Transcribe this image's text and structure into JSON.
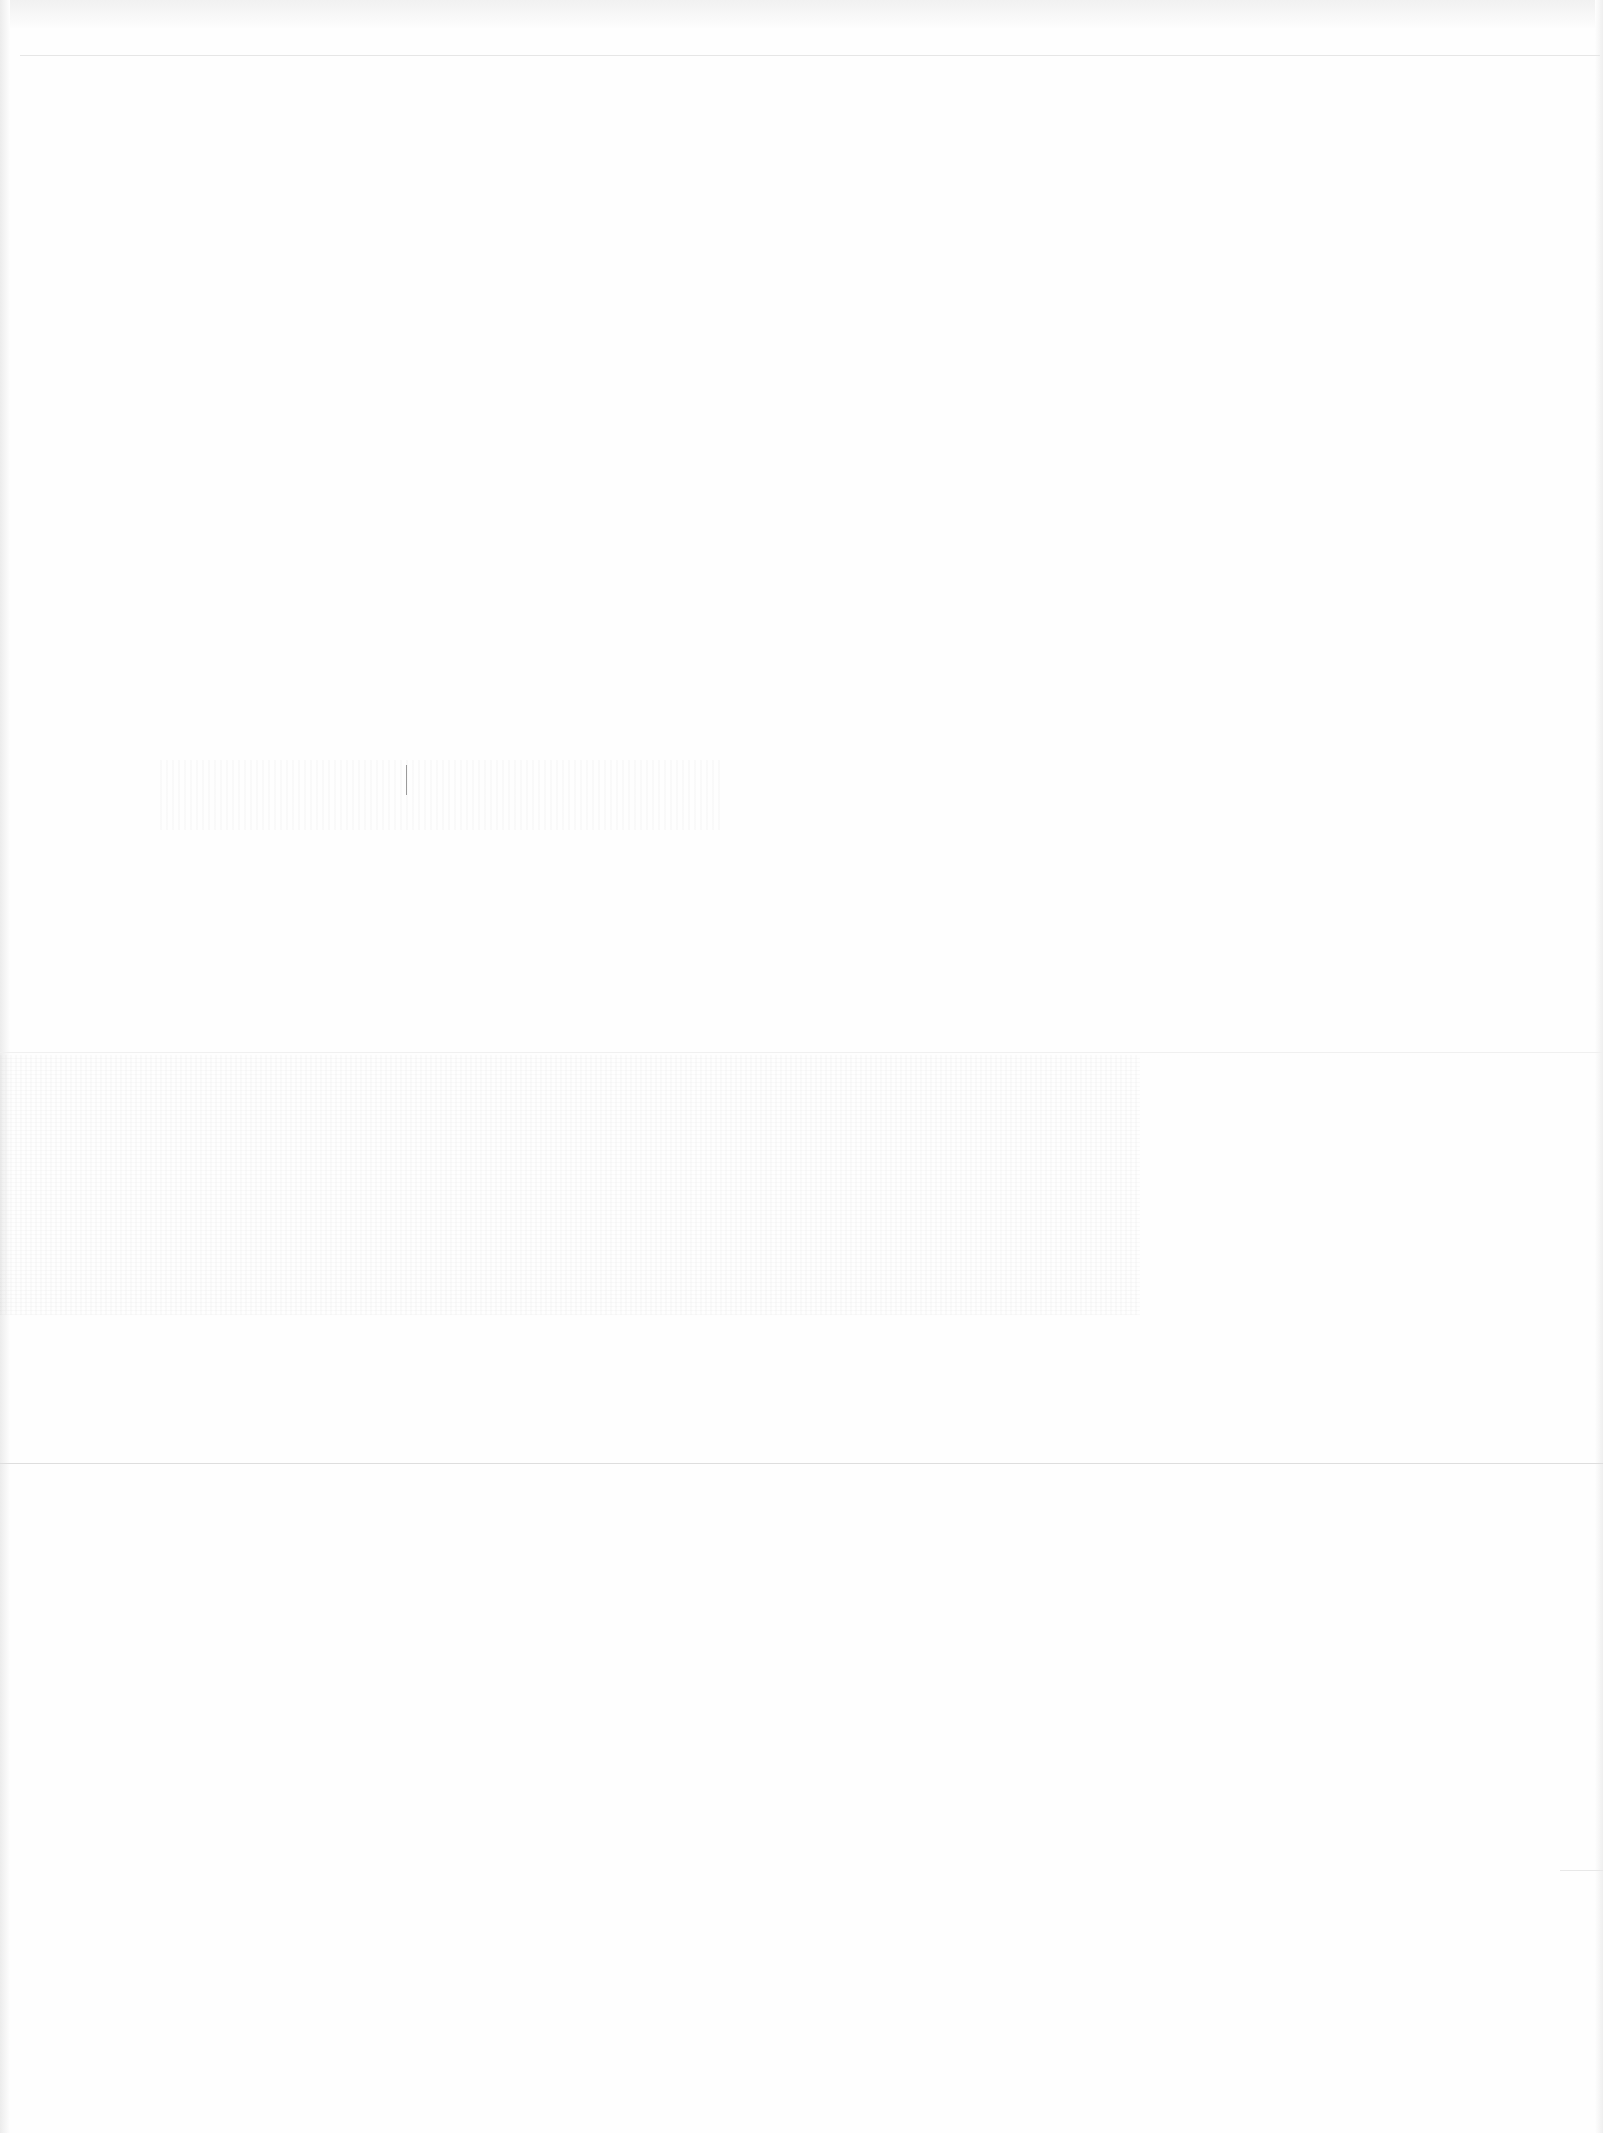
{
  "page": {
    "type": "blank-scanned-page",
    "width": 1603,
    "height": 2133,
    "background_color": "#fefefe",
    "visible_text": []
  },
  "rules": [
    {
      "y": 55,
      "x_start": 20,
      "x_end": 1600,
      "color": "#e6e6e6"
    },
    {
      "y": 1052,
      "x_start": 0,
      "x_end": 1603,
      "color": "#f0f0f0"
    },
    {
      "y": 1463,
      "x_start": 0,
      "x_end": 1603,
      "color": "#dedede"
    },
    {
      "y": 1870,
      "x_start": 1560,
      "x_end": 1603,
      "color": "#e8e8e8"
    }
  ],
  "colors": {
    "paper": "#fefefe",
    "edge_shadow": "#ececec",
    "rule": "#e4e4e4"
  }
}
